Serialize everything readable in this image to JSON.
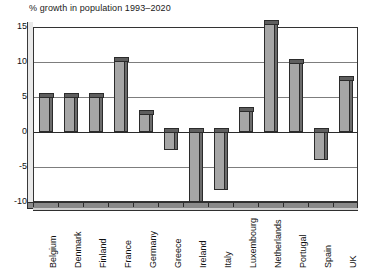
{
  "chart_data": {
    "type": "bar",
    "title": "% growth in population 1993–2020",
    "xlabel": "",
    "ylabel": "",
    "ylim": [
      -10,
      15
    ],
    "yticks": [
      15,
      10,
      5,
      0,
      -5,
      -10
    ],
    "ytick_labels": [
      "15",
      "10",
      "5",
      "0",
      "-5",
      "-10"
    ],
    "grid": true,
    "legend": "none",
    "style": "3d-column",
    "categories": [
      "Belgium",
      "Denmark",
      "Finland",
      "France",
      "Germany",
      "Greece",
      "Ireland",
      "Italy",
      "Luxembourg",
      "Netherlands",
      "Portugal",
      "Spain",
      "UK"
    ],
    "values": [
      5.0,
      5.0,
      5.0,
      10.2,
      2.6,
      -2.5,
      -10.0,
      -8.3,
      3.0,
      15.5,
      9.8,
      -4.0,
      7.5
    ],
    "colors": {
      "bar_front": "#a6a6a6",
      "bar_top": "#5e5e5e",
      "bar_side": "#6b6b6b",
      "outline": "#2b2b2b",
      "gridline": "#7d7d7d",
      "background": "#ffffff",
      "text": "#111111"
    }
  }
}
